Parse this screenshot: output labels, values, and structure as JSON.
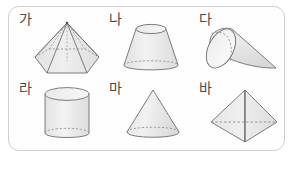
{
  "worksheet": {
    "title": "Solid figures identification panel",
    "panel_border_color": "#cfcfcf",
    "panel_background": "#fefefe",
    "page_background": "#ffffff",
    "shape_fill": "#ebebeb",
    "shape_stroke": "#6e6e6e",
    "hidden_edge_style": "dashed",
    "label_color": "#4a4a4a",
    "rows": 2,
    "columns": 3
  },
  "cells": [
    {
      "label": "가",
      "shape_name": "hexagonal-pyramid",
      "shape_description": "육각뿔",
      "row": 1,
      "column": 1
    },
    {
      "label": "나",
      "shape_name": "truncated-cone",
      "shape_description": "원뿔대",
      "row": 1,
      "column": 2
    },
    {
      "label": "다",
      "shape_name": "cone-on-side",
      "shape_description": "옆으로 누운 원뿔",
      "row": 1,
      "column": 3
    },
    {
      "label": "라",
      "shape_name": "cylinder",
      "shape_description": "원기둥",
      "row": 2,
      "column": 1
    },
    {
      "label": "마",
      "shape_name": "cone",
      "shape_description": "원뿔",
      "row": 2,
      "column": 2
    },
    {
      "label": "바",
      "shape_name": "triangular-pyramid",
      "shape_description": "삼각뿔",
      "row": 2,
      "column": 3
    }
  ]
}
